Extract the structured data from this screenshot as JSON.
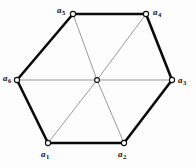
{
  "figure": {
    "type": "undirected-graph-diagram",
    "background_color": "#fdfdfd",
    "perimeter_edge_color": "#0a0a0a",
    "perimeter_edge_width": 2.6,
    "spoke_edge_color": "#6f6f6f",
    "spoke_edge_width": 0.7,
    "vertex_fill": "#ffffff",
    "vertex_stroke": "#0a0a0a",
    "vertex_radius": 2.6,
    "center_vertex_radius": 2.4,
    "nodes": [
      {
        "id": "a1",
        "label": "a",
        "subscript": "1",
        "x": 48,
        "y": 143,
        "label_x": 41,
        "label_y": 150
      },
      {
        "id": "a2",
        "label": "a",
        "subscript": "2",
        "x": 124,
        "y": 143,
        "label_x": 118,
        "label_y": 150
      },
      {
        "id": "a3",
        "label": "a",
        "subscript": "3",
        "x": 172,
        "y": 80,
        "label_x": 178,
        "label_y": 76
      },
      {
        "id": "a4",
        "label": "a",
        "subscript": "4",
        "x": 146,
        "y": 14,
        "label_x": 153,
        "label_y": 8
      },
      {
        "id": "a5",
        "label": "a",
        "subscript": "5",
        "x": 73,
        "y": 14,
        "label_x": 57,
        "label_y": 6
      },
      {
        "id": "a6",
        "label": "a",
        "subscript": "6",
        "x": 17,
        "y": 80,
        "label_x": 3,
        "label_y": 74
      },
      {
        "id": "center",
        "label": "",
        "subscript": "",
        "x": 97,
        "y": 80,
        "label_x": 0,
        "label_y": 0
      }
    ],
    "perimeter_edges": [
      {
        "from": "a1",
        "to": "a2"
      },
      {
        "from": "a2",
        "to": "a3"
      },
      {
        "from": "a3",
        "to": "a4"
      },
      {
        "from": "a4",
        "to": "a5"
      },
      {
        "from": "a5",
        "to": "a6"
      },
      {
        "from": "a6",
        "to": "a1"
      }
    ],
    "spoke_edges": [
      {
        "from": "center",
        "to": "a1"
      },
      {
        "from": "center",
        "to": "a2"
      },
      {
        "from": "center",
        "to": "a3"
      },
      {
        "from": "center",
        "to": "a4"
      },
      {
        "from": "center",
        "to": "a5"
      },
      {
        "from": "center",
        "to": "a6"
      }
    ]
  }
}
